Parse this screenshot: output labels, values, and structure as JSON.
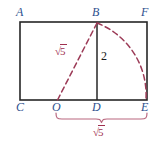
{
  "figure": {
    "colors": {
      "vertex_label": "#2d4f8e",
      "measure_label": "#a03050",
      "outline": "#262626",
      "length_label": "#1a1a1a",
      "background": "#ffffff"
    },
    "vertices": [
      {
        "id": "A",
        "label": "A",
        "x": 20,
        "y": 22,
        "lx": 16,
        "ly": 6
      },
      {
        "id": "B",
        "label": "B",
        "x": 97,
        "y": 22,
        "lx": 92,
        "ly": 6
      },
      {
        "id": "F",
        "label": "F",
        "x": 147,
        "y": 22,
        "lx": 141,
        "ly": 6
      },
      {
        "id": "C",
        "label": "C",
        "x": 20,
        "y": 100,
        "lx": 16,
        "ly": 101
      },
      {
        "id": "O",
        "label": "O",
        "x": 57,
        "y": 100,
        "lx": 52,
        "ly": 101
      },
      {
        "id": "D",
        "label": "D",
        "x": 97,
        "y": 100,
        "lx": 92,
        "ly": 101
      },
      {
        "id": "E",
        "label": "E",
        "x": 147,
        "y": 100,
        "lx": 141,
        "ly": 101
      }
    ],
    "measures": {
      "diagonal": {
        "symbol": "√",
        "value": "5",
        "text": "√5",
        "x": 55,
        "y": 46
      },
      "height": {
        "text": "2",
        "x": 101,
        "y": 50
      },
      "base": {
        "symbol": "√",
        "value": "5",
        "text": "√5",
        "x": 93,
        "y": 127
      }
    },
    "brace": {
      "from": "O",
      "to": "E",
      "x_start": 56,
      "x_end": 147,
      "y": 113
    },
    "arc": {
      "from": "B",
      "to": "E",
      "center": "D",
      "radius": "√5"
    }
  }
}
